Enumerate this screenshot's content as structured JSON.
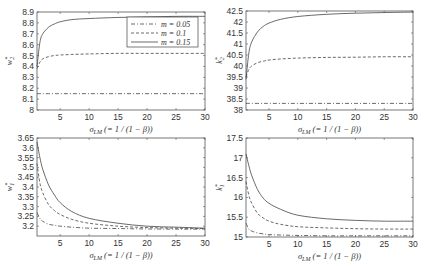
{
  "chart_data": [
    {
      "type": "line",
      "panel": "top-left",
      "title": "",
      "xlabel": "σ_LM (= 1 / (1 − β))",
      "ylabel": "w₂*",
      "xlim": [
        1,
        30
      ],
      "ylim": [
        8.0,
        8.9
      ],
      "xticks": [
        5,
        10,
        15,
        20,
        25,
        30
      ],
      "yticks": [
        8,
        8.1,
        8.2,
        8.3,
        8.4,
        8.5,
        8.6,
        8.7,
        8.8,
        8.9
      ],
      "grid": false,
      "legend_position": "upper right",
      "x": [
        1,
        1.5,
        2,
        3,
        4,
        5,
        7,
        10,
        15,
        20,
        25,
        30
      ],
      "series": [
        {
          "name": "m = 0.05",
          "style": "dashdot",
          "values": [
            8.15,
            8.15,
            8.15,
            8.15,
            8.15,
            8.15,
            8.15,
            8.15,
            8.15,
            8.15,
            8.15,
            8.15
          ]
        },
        {
          "name": "m = 0.1",
          "style": "dashed",
          "values": [
            8.38,
            8.44,
            8.47,
            8.49,
            8.5,
            8.505,
            8.51,
            8.515,
            8.52,
            8.52,
            8.52,
            8.52
          ]
        },
        {
          "name": "m = 0.15",
          "style": "solid",
          "values": [
            8.4,
            8.62,
            8.7,
            8.76,
            8.79,
            8.81,
            8.83,
            8.84,
            8.85,
            8.855,
            8.86,
            8.86
          ]
        }
      ]
    },
    {
      "type": "line",
      "panel": "top-right",
      "title": "",
      "xlabel": "σ_LM (= 1 / (1 − β))",
      "ylabel": "k₂*",
      "xlim": [
        1,
        30
      ],
      "ylim": [
        38,
        42.5
      ],
      "xticks": [
        5,
        10,
        15,
        20,
        25,
        30
      ],
      "yticks": [
        38,
        38.5,
        39,
        39.5,
        40,
        40.5,
        41,
        41.5,
        42,
        42.5
      ],
      "grid": false,
      "x": [
        1,
        1.5,
        2,
        3,
        4,
        5,
        7,
        10,
        15,
        20,
        25,
        30
      ],
      "series": [
        {
          "name": "m = 0.05",
          "style": "dashdot",
          "values": [
            38.3,
            38.3,
            38.3,
            38.3,
            38.3,
            38.3,
            38.3,
            38.3,
            38.3,
            38.3,
            38.3,
            38.3
          ]
        },
        {
          "name": "m = 0.1",
          "style": "dashed",
          "values": [
            39.5,
            39.85,
            40.0,
            40.15,
            40.22,
            40.27,
            40.32,
            40.36,
            40.39,
            40.4,
            40.42,
            40.42
          ]
        },
        {
          "name": "m = 0.15",
          "style": "solid",
          "values": [
            39.4,
            40.6,
            41.1,
            41.55,
            41.8,
            41.95,
            42.12,
            42.25,
            42.35,
            42.4,
            42.43,
            42.45
          ]
        }
      ]
    },
    {
      "type": "line",
      "panel": "bottom-left",
      "title": "",
      "xlabel": "σ_LM (= 1 / (1 − β))",
      "ylabel": "w₁*",
      "xlim": [
        1,
        30
      ],
      "ylim": [
        3.15,
        3.65
      ],
      "xticks": [
        5,
        10,
        15,
        20,
        25,
        30
      ],
      "yticks": [
        3.2,
        3.25,
        3.3,
        3.35,
        3.4,
        3.45,
        3.5,
        3.55,
        3.6,
        3.65
      ],
      "grid": false,
      "x": [
        1,
        1.5,
        2,
        3,
        4,
        5,
        7,
        10,
        15,
        20,
        25,
        30
      ],
      "series": [
        {
          "name": "m = 0.05",
          "style": "dashdot",
          "values": [
            3.27,
            3.24,
            3.225,
            3.21,
            3.205,
            3.2,
            3.195,
            3.19,
            3.188,
            3.186,
            3.185,
            3.185
          ]
        },
        {
          "name": "m = 0.1",
          "style": "dashed",
          "values": [
            3.52,
            3.42,
            3.37,
            3.31,
            3.28,
            3.26,
            3.235,
            3.215,
            3.2,
            3.193,
            3.19,
            3.188
          ]
        },
        {
          "name": "m = 0.15",
          "style": "solid",
          "values": [
            3.63,
            3.55,
            3.49,
            3.41,
            3.36,
            3.32,
            3.275,
            3.24,
            3.215,
            3.2,
            3.195,
            3.19
          ]
        }
      ]
    },
    {
      "type": "line",
      "panel": "bottom-right",
      "title": "",
      "xlabel": "σ_LM (= 1 / (1 − β))",
      "ylabel": "k₁*",
      "xlim": [
        1,
        30
      ],
      "ylim": [
        15,
        17.5
      ],
      "xticks": [
        5,
        10,
        15,
        20,
        25,
        30
      ],
      "yticks": [
        15,
        15.5,
        16,
        16.5,
        17,
        17.5
      ],
      "grid": false,
      "x": [
        1,
        1.5,
        2,
        3,
        4,
        5,
        7,
        10,
        15,
        20,
        25,
        30
      ],
      "series": [
        {
          "name": "m = 0.05",
          "style": "dashdot",
          "values": [
            15.35,
            15.2,
            15.15,
            15.1,
            15.08,
            15.06,
            15.05,
            15.04,
            15.03,
            15.03,
            15.03,
            15.03
          ]
        },
        {
          "name": "m = 0.1",
          "style": "dashed",
          "values": [
            16.4,
            16.05,
            15.85,
            15.6,
            15.48,
            15.4,
            15.32,
            15.26,
            15.23,
            15.21,
            15.2,
            15.2
          ]
        },
        {
          "name": "m = 0.15",
          "style": "solid",
          "values": [
            17.1,
            16.8,
            16.55,
            16.2,
            15.98,
            15.85,
            15.7,
            15.55,
            15.46,
            15.42,
            15.4,
            15.4
          ]
        }
      ]
    }
  ],
  "legend": {
    "entries": [
      "m = 0.05",
      "m = 0.1",
      "m = 0.15"
    ]
  },
  "labels": {
    "xlabel_main": "σ",
    "xlabel_sub": "LM",
    "xlabel_rest": " (= 1 / (1 − β))",
    "ylabels": [
      {
        "main": "w",
        "sup": "*",
        "sub": "2"
      },
      {
        "main": "k",
        "sup": "*",
        "sub": "2"
      },
      {
        "main": "w",
        "sup": "*",
        "sub": "1"
      },
      {
        "main": "k",
        "sup": "*",
        "sub": "1"
      }
    ]
  }
}
